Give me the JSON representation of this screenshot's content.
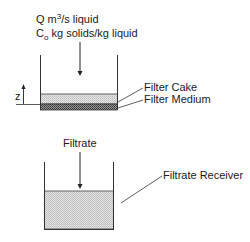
{
  "diagram": {
    "feed": {
      "line1_prefix": "Q m",
      "line1_sup": "3",
      "line1_suffix": "/s liquid",
      "line2_prefix": "C",
      "line2_sub": "o",
      "line2_suffix": " kg solids/kg liquid"
    },
    "height_symbol": "z",
    "labels": {
      "filter_cake": "Filter Cake",
      "filter_medium": "Filter Medium",
      "filtrate": "Filtrate",
      "filtrate_receiver": "Filtrate Receiver"
    },
    "colors": {
      "line": "#333333",
      "cake_fill": "#d9d9d9",
      "medium_fill": "#7a7a7a",
      "filtrate_fill": "#d4d4d4"
    }
  }
}
